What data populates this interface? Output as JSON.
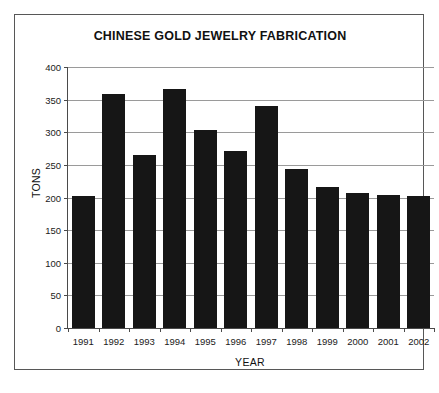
{
  "chart_data": {
    "type": "bar",
    "title": "CHINESE GOLD JEWELRY FABRICATION",
    "xlabel": "YEAR",
    "ylabel": "TONS",
    "categories": [
      "1991",
      "1992",
      "1993",
      "1994",
      "1995",
      "1996",
      "1997",
      "1998",
      "1999",
      "2000",
      "2001",
      "2002"
    ],
    "values": [
      202,
      359,
      265,
      366,
      303,
      272,
      340,
      243,
      216,
      207,
      204,
      203
    ],
    "ylim": [
      0,
      400
    ],
    "ytick_labels": [
      "0",
      "50",
      "100",
      "150",
      "200",
      "250",
      "300",
      "350",
      "400"
    ],
    "ytick_values": [
      0,
      50,
      100,
      150,
      200,
      250,
      300,
      350,
      400
    ],
    "grid": true,
    "legend": false,
    "bar_color": "#161616",
    "grid_color": "#9a9a9a",
    "axis_color": "#4a4a4a"
  }
}
